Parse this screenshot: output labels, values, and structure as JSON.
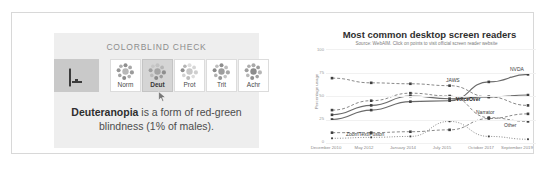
{
  "colorblind_panel": {
    "title": "COLORBLIND CHECK",
    "preview_icon": "monitor-icon",
    "modes": [
      {
        "label": "Norm",
        "selected": false
      },
      {
        "label": "Deut",
        "selected": true
      },
      {
        "label": "Prot",
        "selected": false
      },
      {
        "label": "Trit",
        "selected": false
      },
      {
        "label": "Achr",
        "selected": false
      }
    ],
    "description_strong": "Deuteranopia",
    "description_rest": " is a form of red-green blindness (1% of males).",
    "cursor_icon": "mouse-cursor-icon",
    "panel_bg": "#eeeeee",
    "selected_bg": "#d5d5d5",
    "swatch_bg": "#c9c9c9"
  },
  "chart_data": {
    "type": "line",
    "title": "Most common desktop screen readers",
    "subtitle": "Source: WebAIM. Click on points to visit official screen reader website",
    "xlabel": "",
    "ylabel": "Percentage usage",
    "ylim": [
      0,
      100
    ],
    "yticks": [
      0,
      25,
      50,
      75,
      100
    ],
    "ytick_labels": [
      "0",
      "25",
      "50",
      "75",
      "100"
    ],
    "grid": true,
    "legend": "inline-right-labels",
    "categories": [
      "December 2010",
      "May 2012",
      "January 2014",
      "July 2015",
      "October 2017",
      "September 2019"
    ],
    "series": [
      {
        "name": "JAWS",
        "values": [
          69,
          64,
          63,
          61,
          49,
          40
        ],
        "style": "dashed",
        "label_x": 148,
        "label_y": 32
      },
      {
        "name": "NVDA",
        "values": [
          25,
          35,
          44,
          45,
          65,
          73
        ],
        "style": "solid",
        "label_x": 212,
        "label_y": 22
      },
      {
        "name": "VoiceOver",
        "values": [
          30,
          40,
          50,
          47,
          49,
          51
        ],
        "style": "solid",
        "label_x": 160,
        "label_y": 53,
        "bold": true
      },
      {
        "name": "Narrator",
        "values": [
          11,
          11,
          12,
          14,
          26,
          31
        ],
        "style": "dashed",
        "label_x": 178,
        "label_y": 63
      },
      {
        "name": "Other",
        "values": [
          35,
          45,
          53,
          50,
          27,
          23
        ],
        "style": "dashed",
        "label_x": 204,
        "label_y": 77
      },
      {
        "name": "ZoomText/Fusion",
        "values": [
          5,
          6,
          7,
          23,
          7,
          4
        ],
        "style": "dotted",
        "label_x": 44,
        "label_y": 86
      }
    ]
  }
}
